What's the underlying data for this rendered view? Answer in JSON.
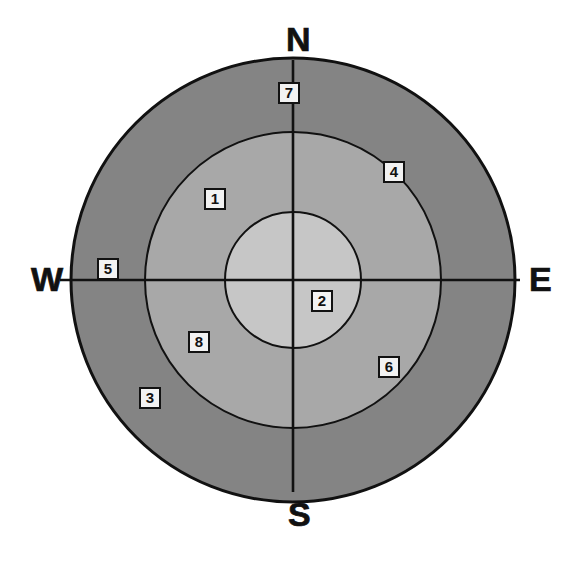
{
  "figure": {
    "type": "concentric-zone-map",
    "background_color": "#ffffff",
    "center": {
      "x": 293,
      "y": 280
    },
    "compass": {
      "north": "N",
      "south": "S",
      "east": "E",
      "west": "W"
    },
    "rings": [
      {
        "name": "outer-ring",
        "radius": 222,
        "fill": "#848484"
      },
      {
        "name": "middle-ring",
        "radius": 148,
        "fill": "#a8a8a8"
      },
      {
        "name": "inner-circle",
        "radius": 68,
        "fill": "#c6c6c6"
      }
    ],
    "axes": {
      "stroke": "#111111",
      "vertical_extent": {
        "from_y": 60,
        "to_y": 492
      },
      "horizontal_extent": {
        "from_x": 60,
        "to_x": 520
      }
    },
    "zone_labels": [
      {
        "id": "1",
        "text": "1",
        "x": 215,
        "y": 199,
        "zone": "middle-ring",
        "quadrant": "NW"
      },
      {
        "id": "2",
        "text": "2",
        "x": 322,
        "y": 301,
        "zone": "inner-circle",
        "quadrant": "SE"
      },
      {
        "id": "3",
        "text": "3",
        "x": 150,
        "y": 398,
        "zone": "outer-ring",
        "quadrant": "SW"
      },
      {
        "id": "4",
        "text": "4",
        "x": 394,
        "y": 172,
        "zone": "ring-boundary-outer-middle",
        "quadrant": "NE"
      },
      {
        "id": "5",
        "text": "5",
        "x": 108,
        "y": 269,
        "zone": "outer-ring",
        "quadrant": "W-axis"
      },
      {
        "id": "6",
        "text": "6",
        "x": 389,
        "y": 367,
        "zone": "ring-boundary-outer-middle",
        "quadrant": "SE"
      },
      {
        "id": "7",
        "text": "7",
        "x": 289,
        "y": 93,
        "zone": "outer-ring",
        "quadrant": "N-axis"
      },
      {
        "id": "8",
        "text": "8",
        "x": 199,
        "y": 342,
        "zone": "middle-ring",
        "quadrant": "SW"
      }
    ]
  },
  "chart_data": {
    "type": "pie",
    "title": "",
    "categories": [
      "1",
      "2",
      "3",
      "4",
      "5",
      "6",
      "7",
      "8"
    ],
    "values": [
      1,
      2,
      3,
      4,
      5,
      6,
      7,
      8
    ],
    "xlabel": "",
    "ylabel": "",
    "legend_position": "none",
    "grid": false,
    "annotations": [
      "N",
      "E",
      "S",
      "W"
    ]
  }
}
